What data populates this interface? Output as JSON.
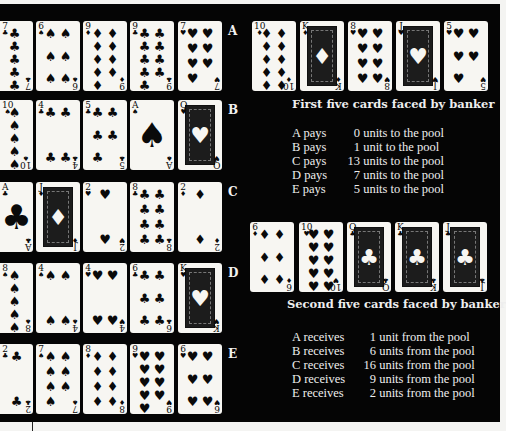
{
  "players": [
    {
      "label": "A",
      "cards": [
        {
          "rank": "7",
          "suit": "♣"
        },
        {
          "rank": "6",
          "suit": "♠"
        },
        {
          "rank": "9",
          "suit": "♦"
        },
        {
          "rank": "9",
          "suit": "♣"
        },
        {
          "rank": "7",
          "suit": "♥"
        }
      ]
    },
    {
      "label": "B",
      "cards": [
        {
          "rank": "10",
          "suit": "♠"
        },
        {
          "rank": "4",
          "suit": "♣"
        },
        {
          "rank": "5",
          "suit": "♣"
        },
        {
          "rank": "A",
          "suit": "♠"
        },
        {
          "rank": "Q",
          "suit": "♥"
        }
      ]
    },
    {
      "label": "C",
      "cards": [
        {
          "rank": "A",
          "suit": "♣"
        },
        {
          "rank": "J",
          "suit": "♦"
        },
        {
          "rank": "2",
          "suit": "♥"
        },
        {
          "rank": "8",
          "suit": "♣"
        },
        {
          "rank": "2",
          "suit": "♦"
        }
      ]
    },
    {
      "label": "D",
      "cards": [
        {
          "rank": "8",
          "suit": "♠"
        },
        {
          "rank": "4",
          "suit": "♠"
        },
        {
          "rank": "4",
          "suit": "♥"
        },
        {
          "rank": "6",
          "suit": "♣"
        },
        {
          "rank": "K",
          "suit": "♥"
        }
      ]
    },
    {
      "label": "E",
      "cards": [
        {
          "rank": "2",
          "suit": "♣"
        },
        {
          "rank": "7",
          "suit": "♠"
        },
        {
          "rank": "8",
          "suit": "♦"
        },
        {
          "rank": "9",
          "suit": "♥"
        },
        {
          "rank": "6",
          "suit": "♥"
        }
      ]
    }
  ],
  "banker": {
    "first": {
      "caption": "First five cards faced by banker",
      "cards": [
        {
          "rank": "10",
          "suit": "♦"
        },
        {
          "rank": "K",
          "suit": "♦"
        },
        {
          "rank": "8",
          "suit": "♥"
        },
        {
          "rank": "J",
          "suit": "♥"
        },
        {
          "rank": "5",
          "suit": "♥"
        }
      ]
    },
    "second": {
      "caption": "Second five cards faced by banker",
      "cards": [
        {
          "rank": "6",
          "suit": "♦"
        },
        {
          "rank": "10",
          "suit": "♥"
        },
        {
          "rank": "Q",
          "suit": "♣"
        },
        {
          "rank": "K",
          "suit": "♣"
        },
        {
          "rank": "J",
          "suit": "♣"
        }
      ]
    }
  },
  "payments": [
    {
      "who": "A pays",
      "amount": "0",
      "text": "units to the pool"
    },
    {
      "who": "B pays",
      "amount": "1",
      "text": "unit to the pool"
    },
    {
      "who": "C pays",
      "amount": "13",
      "text": "units to the pool"
    },
    {
      "who": "D pays",
      "amount": "7",
      "text": "units to the pool"
    },
    {
      "who": "E pays",
      "amount": "5",
      "text": "units to the pool"
    }
  ],
  "receipts": [
    {
      "who": "A receives",
      "amount": "1",
      "text": "unit from the pool"
    },
    {
      "who": "B receives",
      "amount": "6",
      "text": "units from the pool"
    },
    {
      "who": "C receives",
      "amount": "16",
      "text": "units from the pool"
    },
    {
      "who": "D receives",
      "amount": "9",
      "text": "units from the pool"
    },
    {
      "who": "E receives",
      "amount": "2",
      "text": "units from the pool"
    }
  ]
}
